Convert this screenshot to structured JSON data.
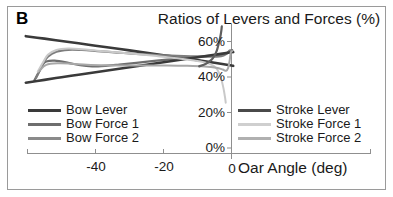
{
  "panel": {
    "label": "B"
  },
  "chart_data": {
    "type": "line",
    "title": "Ratios of Levers and Forces (%)",
    "xlabel": "Oar Angle (deg)",
    "ylabel": "",
    "xlim": [
      -61,
      0.5
    ],
    "ylim": [
      0,
      68
    ],
    "xticks": [
      -40,
      -20,
      0
    ],
    "xtick_labels": [
      "-40",
      "-20",
      "0"
    ],
    "yticks": [
      0,
      20,
      40,
      60
    ],
    "ytick_labels": [
      "0%",
      "20%",
      "40%",
      "60%"
    ],
    "grid": false,
    "legend_position": "inside-lower-left-and-lower-right",
    "series": [
      {
        "name": "Bow Lever",
        "color": "#3a3a3a",
        "width": 2.6,
        "points": [
          [
            -60.5,
            63.0
          ],
          [
            -55,
            61.6
          ],
          [
            -50,
            60.3
          ],
          [
            -45,
            59.0
          ],
          [
            -40,
            57.6
          ],
          [
            -35,
            56.3
          ],
          [
            -30,
            55.0
          ],
          [
            -25,
            53.6
          ],
          [
            -20,
            52.3
          ],
          [
            -15,
            50.9
          ],
          [
            -10,
            49.5
          ],
          [
            -5,
            48.0
          ],
          [
            0,
            46.5
          ],
          [
            0.4,
            46.3
          ]
        ]
      },
      {
        "name": "Bow Force 1",
        "color": "#6e6e6e",
        "width": 2.2,
        "points": [
          [
            -58.0,
            38.0
          ],
          [
            -56.5,
            43.5
          ],
          [
            -55.5,
            47.0
          ],
          [
            -54.5,
            48.7
          ],
          [
            -52.0,
            49.2
          ],
          [
            -48.0,
            48.0
          ],
          [
            -44.5,
            46.6
          ],
          [
            -41.0,
            46.0
          ],
          [
            -37.0,
            46.3
          ],
          [
            -33.0,
            47.0
          ],
          [
            -28.0,
            48.0
          ],
          [
            -22.0,
            49.2
          ],
          [
            -16.0,
            50.3
          ],
          [
            -10.0,
            51.3
          ],
          [
            -5.0,
            52.2
          ],
          [
            -2.0,
            53.0
          ],
          [
            -0.9,
            54.2
          ],
          [
            -0.5,
            54.9
          ],
          [
            0.2,
            55.1
          ]
        ]
      },
      {
        "name": "Bow Force 2",
        "color": "#7d7d7d",
        "width": 2.2,
        "points": [
          [
            -57.5,
            39.5
          ],
          [
            -56.3,
            44.0
          ],
          [
            -55.3,
            47.8
          ],
          [
            -54.0,
            51.5
          ],
          [
            -51.5,
            54.2
          ],
          [
            -48.0,
            55.3
          ],
          [
            -44.0,
            55.2
          ],
          [
            -39.5,
            54.6
          ],
          [
            -34.5,
            53.9
          ],
          [
            -29.5,
            53.2
          ],
          [
            -24.0,
            52.6
          ],
          [
            -18.0,
            52.1
          ],
          [
            -12.0,
            51.7
          ],
          [
            -7.0,
            51.5
          ],
          [
            -3.0,
            51.8
          ],
          [
            -1.5,
            53.0
          ],
          [
            -0.8,
            54.4
          ],
          [
            0.2,
            54.9
          ]
        ]
      },
      {
        "name": "Stroke Lever",
        "color": "#3a3a3a",
        "width": 2.6,
        "points": [
          [
            -60.5,
            36.8
          ],
          [
            -55,
            38.4
          ],
          [
            -50,
            39.9
          ],
          [
            -45,
            41.3
          ],
          [
            -40,
            42.7
          ],
          [
            -35,
            44.1
          ],
          [
            -30,
            45.5
          ],
          [
            -25,
            46.9
          ],
          [
            -20,
            48.3
          ],
          [
            -15,
            49.7
          ],
          [
            -10,
            51.1
          ],
          [
            -5,
            52.5
          ],
          [
            0,
            53.9
          ],
          [
            0.4,
            54.0
          ]
        ]
      },
      {
        "name": "Stroke Force 1",
        "color": "#c9c9c9",
        "width": 2.0,
        "points": [
          [
            -57.0,
            43.0
          ],
          [
            -55.5,
            48.0
          ],
          [
            -54.0,
            52.5
          ],
          [
            -51.5,
            55.2
          ],
          [
            -48.0,
            56.0
          ],
          [
            -44.0,
            55.6
          ],
          [
            -39.5,
            54.8
          ],
          [
            -34.0,
            53.9
          ],
          [
            -28.0,
            52.9
          ],
          [
            -22.0,
            51.8
          ],
          [
            -16.0,
            50.6
          ],
          [
            -11.0,
            49.3
          ],
          [
            -7.0,
            47.8
          ],
          [
            -4.5,
            45.0
          ],
          [
            -3.2,
            40.0
          ],
          [
            -2.4,
            34.0
          ],
          [
            -1.9,
            28.5
          ],
          [
            -1.7,
            25.5
          ]
        ]
      },
      {
        "name": "Stroke Force 2",
        "color": "#a8a8a8",
        "width": 2.0,
        "points": [
          [
            -56.5,
            43.5
          ],
          [
            -54.5,
            46.8
          ],
          [
            -51.0,
            47.7
          ],
          [
            -47.0,
            47.5
          ],
          [
            -42.5,
            46.9
          ],
          [
            -37.0,
            46.6
          ],
          [
            -31.0,
            46.5
          ],
          [
            -25.0,
            46.5
          ],
          [
            -19.0,
            46.5
          ],
          [
            -13.0,
            46.3
          ],
          [
            -8.0,
            45.9
          ],
          [
            -4.5,
            45.2
          ],
          [
            -2.6,
            44.2
          ],
          [
            -1.6,
            43.5
          ],
          [
            -1.0,
            45.0
          ],
          [
            -0.6,
            48.5
          ],
          [
            -0.35,
            52.0
          ],
          [
            -0.15,
            54.2
          ],
          [
            0.2,
            54.6
          ]
        ]
      },
      {
        "name": "Stroke Force 1 rising branch",
        "color": "#5f5f5f",
        "width": 2.2,
        "legend": false,
        "points": [
          [
            -9.5,
            46.0
          ],
          [
            -7.5,
            47.5
          ],
          [
            -6.0,
            49.5
          ],
          [
            -5.0,
            52.0
          ],
          [
            -4.3,
            55.0
          ],
          [
            -3.8,
            58.5
          ],
          [
            -3.3,
            62.5
          ],
          [
            -3.0,
            66.0
          ],
          [
            -2.85,
            68.5
          ]
        ]
      }
    ]
  },
  "legend": {
    "left": [
      {
        "label": "Bow Lever",
        "color": "#3a3a3a"
      },
      {
        "label": "Bow Force 1",
        "color": "#6e6e6e"
      },
      {
        "label": "Bow Force 2",
        "color": "#8a8a8a"
      }
    ],
    "right": [
      {
        "label": "Stroke Lever",
        "color": "#4a4a4a"
      },
      {
        "label": "Stroke Force 1",
        "color": "#cfcfcf"
      },
      {
        "label": "Stroke Force 2",
        "color": "#b0b0b0"
      }
    ]
  },
  "axis": {
    "ytick_0": "0%",
    "ytick_20": "20%",
    "ytick_40": "40%",
    "ytick_60": "60%",
    "xtick_m40": "-40",
    "xtick_m20": "-20",
    "xtick_0": "0",
    "xtitle": "Oar Angle (deg)"
  }
}
